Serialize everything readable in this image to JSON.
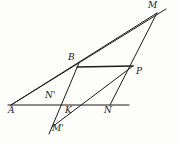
{
  "figure": {
    "type": "geometry-diagram",
    "background_color": "#fdfdfc",
    "stroke_color": "#1d1d1d",
    "canvas": {
      "width": 179,
      "height": 145
    },
    "points": [
      {
        "id": "A",
        "label": "A",
        "x": 11,
        "y": 105,
        "label_x": 10,
        "label_y": 107
      },
      {
        "id": "B",
        "label": "B",
        "x": 77,
        "y": 67,
        "label_x": 69,
        "label_y": 54
      },
      {
        "id": "P",
        "label": "P",
        "x": 133,
        "y": 66,
        "label_x": 136,
        "label_y": 68
      },
      {
        "id": "M",
        "label": "M",
        "x": 155,
        "y": 13,
        "label_x": 150,
        "label_y": 2
      },
      {
        "id": "K",
        "label": "K",
        "x": 68,
        "y": 105,
        "label_x": 66,
        "label_y": 107
      },
      {
        "id": "N",
        "label": "N",
        "x": 110,
        "y": 105,
        "label_x": 105,
        "label_y": 107
      },
      {
        "id": "Nprime",
        "label": "N'",
        "x": 58,
        "y": 102,
        "label_x": 46,
        "label_y": 92
      },
      {
        "id": "Mprime",
        "label": "M'",
        "x": 52,
        "y": 127,
        "label_x": 52,
        "label_y": 124
      }
    ],
    "segments": [
      {
        "id": "base-line",
        "from": "A",
        "to": "N",
        "x1": 8,
        "y1": 105,
        "x2": 129,
        "y2": 105
      },
      {
        "id": "A-to-M",
        "from": "A",
        "to": "M",
        "x1": 11,
        "y1": 105,
        "x2": 166,
        "y2": 9
      },
      {
        "id": "B-to-P",
        "from": "B",
        "to": "P",
        "x1": 77,
        "y1": 67,
        "x2": 133,
        "y2": 66
      },
      {
        "id": "M-to-N",
        "from": "M",
        "to": "N",
        "x1": 157,
        "y1": 13,
        "x2": 110,
        "y2": 105
      },
      {
        "id": "Mprime-to-B",
        "from": "Mprime",
        "to": "B",
        "x1": 49,
        "y1": 134,
        "x2": 79,
        "y2": 63
      },
      {
        "id": "Mprime-to-P",
        "from": "Mprime",
        "to": "P",
        "x1": 52,
        "y1": 127,
        "x2": 133,
        "y2": 66
      },
      {
        "id": "A-to-Nprime-ray",
        "from": "A",
        "to": "Nprime",
        "x1": 11,
        "y1": 105,
        "x2": 76,
        "y2": 69
      },
      {
        "id": "Nprime-to-M-ray",
        "from": "Nprime",
        "to": "M",
        "x1": 56,
        "y1": 105,
        "x2": 157,
        "y2": 13
      }
    ],
    "labels": [
      "A",
      "B",
      "P",
      "M",
      "K",
      "N",
      "N'",
      "M'"
    ]
  }
}
